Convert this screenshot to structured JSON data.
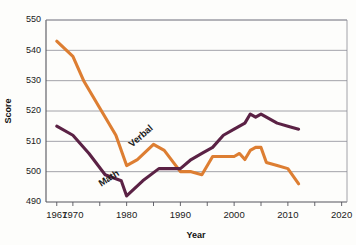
{
  "chart_data": {
    "type": "line",
    "title": "",
    "xlabel": "Year",
    "ylabel": "Score",
    "xlim": [
      1965,
      2021
    ],
    "ylim": [
      490,
      550
    ],
    "grid": true,
    "legend_position": "inline-labels",
    "y_ticks": [
      490,
      500,
      510,
      520,
      530,
      540,
      550
    ],
    "x_ticks": [
      1967,
      1970,
      1975,
      1980,
      1985,
      1990,
      1995,
      2000,
      2005,
      2010,
      2015,
      2020
    ],
    "x_tick_labels": [
      "1967",
      "1970",
      "",
      "1980",
      "",
      "1990",
      "",
      "2000",
      "",
      "2010",
      "",
      "2020"
    ],
    "series": [
      {
        "name": "Verbal",
        "color": "#DD7E32",
        "label_x": 1983,
        "label_y": 511,
        "label_rotation": -41,
        "x": [
          1967,
          1970,
          1972,
          1975,
          1978,
          1980,
          1982,
          1985,
          1987,
          1990,
          1992,
          1994,
          1996,
          1998,
          2000,
          2001,
          2002,
          2003,
          2004,
          2005,
          2006,
          2008,
          2010,
          2012
        ],
        "y": [
          543,
          538,
          530,
          521,
          512,
          502,
          504,
          509,
          507,
          500,
          500,
          499,
          505,
          505,
          505,
          506,
          504,
          507,
          508,
          508,
          503,
          502,
          501,
          496
        ]
      },
      {
        "name": "Math",
        "color": "#5B2245",
        "label_x": 1977,
        "label_y": 497,
        "label_rotation": -33,
        "x": [
          1967,
          1970,
          1973,
          1976,
          1979,
          1980,
          1983,
          1986,
          1989,
          1990,
          1992,
          1994,
          1996,
          1998,
          2000,
          2002,
          2003,
          2004,
          2005,
          2006,
          2008,
          2010,
          2012
        ],
        "y": [
          515,
          512,
          506,
          499,
          497,
          492,
          497,
          501,
          501,
          501,
          504,
          506,
          508,
          512,
          514,
          516,
          519,
          518,
          519,
          518,
          516,
          515,
          514
        ]
      }
    ]
  },
  "plot": {
    "left": 46,
    "right": 347,
    "top": 20,
    "bottom": 202
  }
}
